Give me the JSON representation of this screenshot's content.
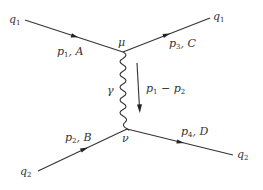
{
  "diagram": {
    "type": "feynman",
    "colors": {
      "line": "#333333",
      "label": "#333333",
      "background": "#ffffff"
    },
    "vertices": [
      {
        "id": "mu",
        "label": "μ",
        "x": 123,
        "y": 52
      },
      {
        "id": "nu",
        "label": "ν",
        "x": 127,
        "y": 129
      }
    ],
    "external": {
      "in_top": {
        "label": "q",
        "sub": "1"
      },
      "out_top": {
        "label": "q",
        "sub": "1"
      },
      "in_bot": {
        "label": "q",
        "sub": "2"
      },
      "out_bot": {
        "label": "q",
        "sub": "2"
      }
    },
    "momenta": {
      "p1A": {
        "p": "p",
        "sub": "1",
        "tail": ", A"
      },
      "p3C": {
        "p": "p",
        "sub": "3",
        "tail": ", C"
      },
      "p2B": {
        "p": "p",
        "sub": "2",
        "tail": ", B"
      },
      "p4D": {
        "p": "p",
        "sub": "4",
        "tail": ", D"
      }
    },
    "propagator": {
      "particle": "γ",
      "momentum": {
        "a": "p",
        "a_sub": "1",
        "op": " − ",
        "b": "p",
        "b_sub": "2"
      }
    }
  }
}
